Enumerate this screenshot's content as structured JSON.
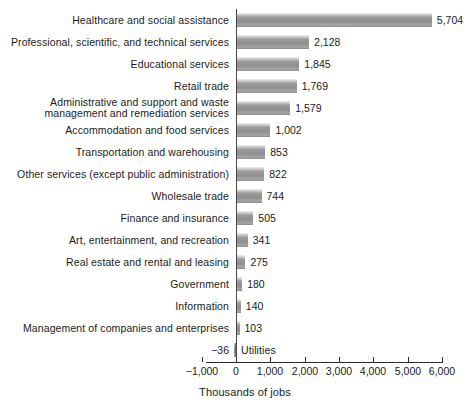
{
  "chart_data": {
    "type": "bar",
    "orientation": "horizontal",
    "title": "",
    "xlabel": "Thousands of jobs",
    "ylabel": "",
    "xlim": [
      -1000,
      6000
    ],
    "xticks": [
      -1000,
      0,
      1000,
      2000,
      3000,
      4000,
      5000,
      6000
    ],
    "xticklabels": [
      "−1,000",
      "0",
      "1,000",
      "2,000",
      "3,000",
      "4,000",
      "5,000",
      "6,000"
    ],
    "grid": false,
    "legend": null,
    "bar_color": "#8f8f8f",
    "categories": [
      "Healthcare and social assistance",
      "Professional, scientific, and technical services",
      "Educational services",
      "Retail trade",
      "Administrative and support and waste management and remediation services",
      "Accommodation and food services",
      "Transportation and warehousing",
      "Other services (except public administration)",
      "Wholesale trade",
      "Finance and insurance",
      "Art, entertainment, and recreation",
      "Real estate and rental and leasing",
      "Government",
      "Information",
      "Management of companies and enterprises",
      "Utilities"
    ],
    "values": [
      5704,
      2128,
      1845,
      1769,
      1579,
      1002,
      853,
      822,
      744,
      505,
      341,
      275,
      180,
      140,
      103,
      -36
    ],
    "value_labels": [
      "5,704",
      "2,128",
      "1,845",
      "1,769",
      "1,579",
      "1,002",
      "853",
      "822",
      "744",
      "505",
      "341",
      "275",
      "180",
      "140",
      "103",
      "−36"
    ]
  },
  "bars": [
    {
      "label": "Healthcare and social assistance",
      "label_lines": [
        "Healthcare and social assistance"
      ],
      "value": 5704,
      "value_label": "5,704"
    },
    {
      "label": "Professional, scientific, and technical services",
      "label_lines": [
        "Professional, scientific, and technical services"
      ],
      "value": 2128,
      "value_label": "2,128"
    },
    {
      "label": "Educational services",
      "label_lines": [
        "Educational services"
      ],
      "value": 1845,
      "value_label": "1,845"
    },
    {
      "label": "Retail trade",
      "label_lines": [
        "Retail trade"
      ],
      "value": 1769,
      "value_label": "1,769"
    },
    {
      "label": "Administrative and support and waste management and remediation services",
      "label_lines": [
        "Administrative and support and waste",
        "management and remediation services"
      ],
      "value": 1579,
      "value_label": "1,579"
    },
    {
      "label": "Accommodation and food services",
      "label_lines": [
        "Accommodation and food services"
      ],
      "value": 1002,
      "value_label": "1,002"
    },
    {
      "label": "Transportation and warehousing",
      "label_lines": [
        "Transportation and warehousing"
      ],
      "value": 853,
      "value_label": "853"
    },
    {
      "label": "Other services (except public administration)",
      "label_lines": [
        "Other services (except public administration)"
      ],
      "value": 822,
      "value_label": "822"
    },
    {
      "label": "Wholesale trade",
      "label_lines": [
        "Wholesale trade"
      ],
      "value": 744,
      "value_label": "744"
    },
    {
      "label": "Finance and insurance",
      "label_lines": [
        "Finance and insurance"
      ],
      "value": 505,
      "value_label": "505"
    },
    {
      "label": "Art, entertainment, and recreation",
      "label_lines": [
        "Art, entertainment, and recreation"
      ],
      "value": 341,
      "value_label": "341"
    },
    {
      "label": "Real estate and rental and leasing",
      "label_lines": [
        "Real estate and rental and leasing"
      ],
      "value": 275,
      "value_label": "275"
    },
    {
      "label": "Government",
      "label_lines": [
        "Government"
      ],
      "value": 180,
      "value_label": "180"
    },
    {
      "label": "Information",
      "label_lines": [
        "Information"
      ],
      "value": 140,
      "value_label": "140"
    },
    {
      "label": "Management of companies and enterprises",
      "label_lines": [
        "Management of companies and enterprises"
      ],
      "value": 103,
      "value_label": "103"
    },
    {
      "label": "Utilities",
      "label_lines": [
        "Utilities"
      ],
      "value": -36,
      "value_label": "−36"
    }
  ],
  "axis": {
    "title": "Thousands of jobs",
    "ticks": [
      {
        "value": -1000,
        "label": "−1,000"
      },
      {
        "value": 0,
        "label": "0"
      },
      {
        "value": 1000,
        "label": "1,000"
      },
      {
        "value": 2000,
        "label": "2,000"
      },
      {
        "value": 3000,
        "label": "3,000"
      },
      {
        "value": 4000,
        "label": "4,000"
      },
      {
        "value": 5000,
        "label": "5,000"
      },
      {
        "value": 6000,
        "label": "6,000"
      }
    ]
  }
}
